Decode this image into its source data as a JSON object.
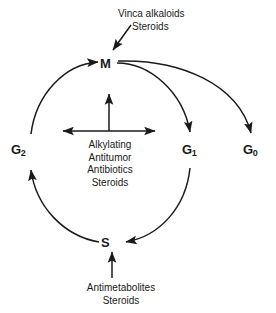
{
  "diagram": {
    "background_color": "#ffffff",
    "stroke_color": "#1a1a1a",
    "phases": [
      {
        "id": "m",
        "label": "M",
        "subscript": "",
        "name": "mitosis"
      },
      {
        "id": "g1",
        "label": "G",
        "subscript": "1",
        "name": "gap-1"
      },
      {
        "id": "s",
        "label": "S",
        "subscript": "",
        "name": "synthesis"
      },
      {
        "id": "g2",
        "label": "G",
        "subscript": "2",
        "name": "gap-2"
      },
      {
        "id": "g0",
        "label": "G",
        "subscript": "0",
        "name": "resting"
      }
    ],
    "annotations": {
      "mitosis_drugs": {
        "line1": "Vinca alkaloids",
        "line2": "Steroids",
        "target": "M"
      },
      "nonspecific_drugs": {
        "line1": "Alkylating",
        "line2": "Antitumor",
        "line3": "Antibiotics",
        "line4": "Steroids",
        "target": "all phases"
      },
      "synthesis_drugs": {
        "line1": "Antimetabolites",
        "line2": "Steroids",
        "target": "S"
      }
    },
    "flow": [
      {
        "from": "M",
        "to": "G1"
      },
      {
        "from": "G1",
        "to": "S"
      },
      {
        "from": "S",
        "to": "G2"
      },
      {
        "from": "G2",
        "to": "M"
      },
      {
        "from": "M",
        "to": "G0"
      }
    ]
  }
}
